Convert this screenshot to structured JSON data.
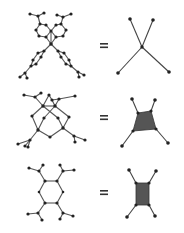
{
  "figure": {
    "colors": {
      "background": "#ffffff",
      "bond": "#555555",
      "atom": "#222222",
      "polygon_fill": "#555555"
    },
    "rows": [
      {
        "id": "row-1",
        "molecule": "spiro tetrahedral linker",
        "operator": "=",
        "simplified": {
          "type": "4-connected point node",
          "center": [
            142,
            47
          ],
          "endpoints": [
            [
              130,
              19
            ],
            [
              153,
              20
            ],
            [
              118,
              73
            ],
            [
              169,
              72
            ]
          ]
        }
      },
      {
        "id": "row-2",
        "molecule": "bicyclic / cage 4-connected linker",
        "operator": "=",
        "simplified": {
          "type": "4-connected quadrilateral node",
          "polygon": [
            [
              138,
              113
            ],
            [
              151,
              111
            ],
            [
              156,
              129
            ],
            [
              133,
              131
            ]
          ],
          "endpoints": [
            [
              132,
              99
            ],
            [
              155,
              100
            ],
            [
              122,
              146
            ],
            [
              168,
              143
            ]
          ]
        }
      },
      {
        "id": "row-3",
        "molecule": "tetrasubstituted benzene linker",
        "operator": "=",
        "simplified": {
          "type": "4-connected rectangle node",
          "polygon": [
            [
              136,
              183
            ],
            [
              149,
              183
            ],
            [
              149,
              205
            ],
            [
              136,
              205
            ]
          ],
          "endpoints": [
            [
              129,
              170
            ],
            [
              156,
              171
            ],
            [
              127,
              217
            ],
            [
              155,
              216
            ]
          ]
        }
      }
    ]
  }
}
